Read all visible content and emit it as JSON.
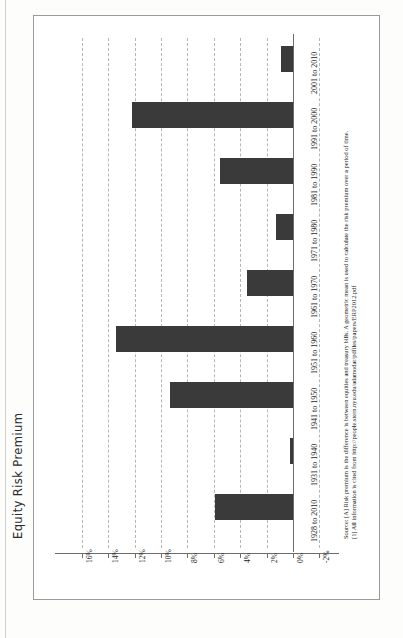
{
  "figure": {
    "title": "Equity Risk Premium",
    "orientation": "page rotated 90 degrees",
    "source_lines": [
      "Source: [A] Risk premium is the difference is between equities and treasury bills. A geometric mean is used to calculate the risk premium over a period of time.",
      "[1] All information is cited from http://people.stern.nyu.edu/adamodar/pdfiles/papers/ERP2012.pdf"
    ]
  },
  "chart_data": {
    "type": "bar",
    "title": "Equity Risk Premium",
    "xlabel": "",
    "ylabel": "Equity Risk Premium",
    "orientation": "horizontal",
    "grid": true,
    "legend": null,
    "ylim": [
      -2,
      16
    ],
    "tick_labels": [
      "16%",
      "14%",
      "12%",
      "10%",
      "8%",
      "6%",
      "4%",
      "2%",
      "0%",
      "-2%"
    ],
    "tick_values": [
      16,
      14,
      12,
      10,
      8,
      6,
      4,
      2,
      0,
      -2
    ],
    "categories": [
      "1928 to 2010",
      "1931 to 1940",
      "1941 to 1950",
      "1951 to 1960",
      "1961 to 1970",
      "1971 to 1980",
      "1981 to 1990",
      "1991 to 2000",
      "2001 to 2010"
    ],
    "values": [
      5.9,
      0.2,
      9.3,
      13.4,
      3.5,
      1.3,
      5.5,
      12.2,
      0.9
    ],
    "series": [
      {
        "name": "Equity Risk Premium",
        "color": "#3a3a3a",
        "values": [
          5.9,
          0.2,
          9.3,
          13.4,
          3.5,
          1.3,
          5.5,
          12.2,
          0.9
        ]
      }
    ]
  }
}
